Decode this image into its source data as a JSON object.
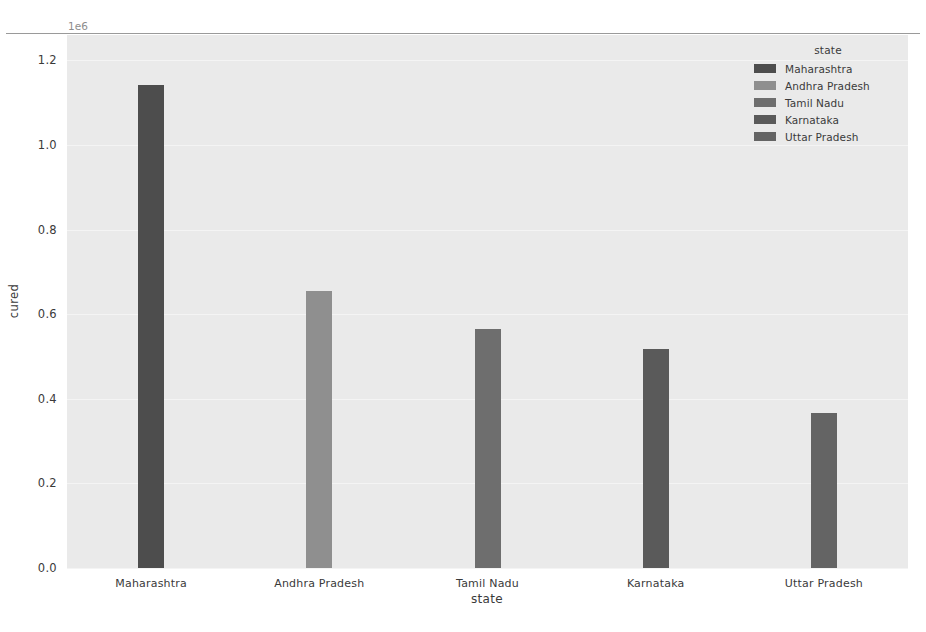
{
  "chart_data": {
    "type": "bar",
    "title": "",
    "subtitle": "",
    "xlabel": "state",
    "ylabel": "cured",
    "categories": [
      "Maharashtra",
      "Andhra Pradesh",
      "Tamil Nadu",
      "Karnataka",
      "Uttar Pradesh"
    ],
    "values": [
      1.143,
      0.655,
      0.565,
      0.517,
      0.367
    ],
    "y_offset_text": "1e6",
    "y_offset_multiplier": 1000000,
    "values_absolute": [
      1143000,
      655000,
      565000,
      517000,
      367000
    ],
    "ylim": [
      0.0,
      1.26
    ],
    "yticks": [
      "0.0",
      "0.2",
      "0.4",
      "0.6",
      "0.8",
      "1.0",
      "1.2"
    ],
    "ytick_values": [
      0.0,
      0.2,
      0.4,
      0.6,
      0.8,
      1.0,
      1.2
    ],
    "grid": true,
    "grid_axis": "y",
    "legend_position": "upper right",
    "legend": {
      "title": "state",
      "entries": [
        {
          "label": "Maharashtra",
          "color": "#4d4d4d"
        },
        {
          "label": "Andhra Pradesh",
          "color": "#8f8f8f"
        },
        {
          "label": "Tamil Nadu",
          "color": "#6e6e6e"
        },
        {
          "label": "Karnataka",
          "color": "#5a5a5a"
        },
        {
          "label": "Uttar Pradesh",
          "color": "#646464"
        }
      ]
    },
    "bar_colors": [
      "#4d4d4d",
      "#8f8f8f",
      "#6e6e6e",
      "#5a5a5a",
      "#646464"
    ],
    "style": {
      "axes_facecolor": "#eaeaea",
      "figure_facecolor": "#ffffff",
      "gridline_color": "#f4f4f4",
      "text_color": "#3a3a3a"
    }
  }
}
